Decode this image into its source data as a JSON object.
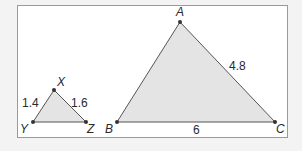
{
  "diagram": {
    "colors": {
      "background": "#f3f3f3",
      "frame_fill": "#ffffff",
      "frame_stroke": "#9a9a9a",
      "triangle_fill": "#e4e4e4",
      "triangle_stroke": "#555555",
      "vertex_dot": "#333333",
      "text": "#2a2a2a"
    },
    "small_triangle": {
      "name": "XYZ",
      "vertices": {
        "X": {
          "label": "X",
          "x": 54,
          "y": 90
        },
        "Y": {
          "label": "Y",
          "x": 33,
          "y": 122
        },
        "Z": {
          "label": "Z",
          "x": 86,
          "y": 122
        }
      },
      "side_labels": {
        "XY": "1.4",
        "XZ": "1.6"
      }
    },
    "large_triangle": {
      "name": "ABC",
      "vertices": {
        "A": {
          "label": "A",
          "x": 180,
          "y": 22
        },
        "B": {
          "label": "B",
          "x": 117,
          "y": 122
        },
        "C": {
          "label": "C",
          "x": 275,
          "y": 122
        }
      },
      "side_labels": {
        "AC": "4.8",
        "BC": "6"
      }
    }
  }
}
